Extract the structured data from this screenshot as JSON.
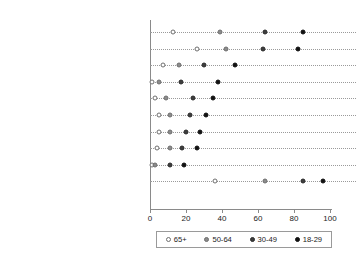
{
  "chart_data": {
    "type": "scatter",
    "subtype": "cleveland-dot-plot",
    "title": "",
    "subtitle": "",
    "xlabel": "",
    "ylabel": "",
    "xlim": [
      0,
      100
    ],
    "ylim": null,
    "grid": false,
    "grid_style": "horizontal dotted leader lines per category",
    "legend_position": "bottom-center",
    "legend_boxed": true,
    "orientation": "horizontal",
    "categories": [
      "Send or receive text messages",
      "Take a picture",
      "Play a game",
      "Play music",
      "Record a video",
      "Access the internet",
      "Send or receive e-mail",
      "Send or receive instant messages",
      "Watch a video",
      "At least one of these activities"
    ],
    "series": [
      {
        "name": "65+",
        "marker": "open-circle",
        "color": "#ffffff",
        "edge_color": "#6e6e6e",
        "values": [
          13,
          26,
          7,
          1,
          3,
          5,
          5,
          4,
          1,
          36
        ]
      },
      {
        "name": "50-64",
        "marker": "filled-circle",
        "color": "#8c8c8c",
        "edge_color": "#6e6e6e",
        "values": [
          39,
          42,
          16,
          5,
          9,
          11,
          11,
          11,
          3,
          64
        ]
      },
      {
        "name": "30-49",
        "marker": "filled-circle",
        "color": "#3d3d3d",
        "edge_color": "#2a2a2a",
        "values": [
          64,
          63,
          30,
          17,
          24,
          22,
          20,
          18,
          11,
          85
        ]
      },
      {
        "name": "18-29",
        "marker": "filled-circle",
        "color": "#111111",
        "edge_color": "#111111",
        "values": [
          85,
          82,
          47,
          38,
          35,
          31,
          28,
          26,
          19,
          96
        ]
      }
    ],
    "xticks": [
      0,
      20,
      40,
      60,
      80,
      100
    ],
    "xticklabels": [
      "0",
      "20",
      "40",
      "60",
      "80",
      "100"
    ]
  },
  "legend": {
    "entries": [
      {
        "label": "65+"
      },
      {
        "label": "50-64"
      },
      {
        "label": "30-49"
      },
      {
        "label": "18-29"
      }
    ]
  }
}
